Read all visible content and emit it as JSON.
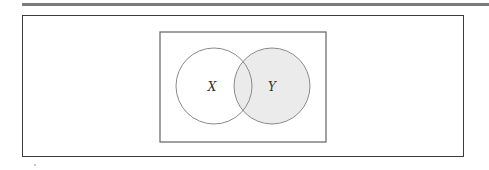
{
  "diagram": {
    "type": "venn",
    "universe": {
      "x": 160,
      "y": 32,
      "width": 166,
      "height": 110,
      "stroke": "#6e6e6e"
    },
    "sets": [
      {
        "label": "X",
        "cx": 214,
        "cy": 86,
        "r": 38,
        "shaded": false,
        "fill": "#ffffff"
      },
      {
        "label": "Y",
        "cx": 272,
        "cy": 86,
        "r": 38,
        "shaded": true,
        "fill": "#ebebeb"
      }
    ],
    "shaded_region": "Y",
    "colors": {
      "stroke": "#8a8a8a",
      "shade": "#ebebeb",
      "frame": "#3a3a3a",
      "rule": "#7a7a7a"
    }
  }
}
